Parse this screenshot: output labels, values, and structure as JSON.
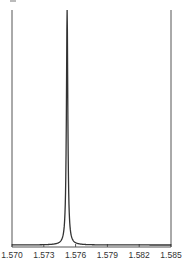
{
  "chart_data": {
    "type": "line",
    "title": "",
    "xlabel": "",
    "ylabel": "",
    "xlim": [
      1.57,
      1.585
    ],
    "ylim": [
      0,
      1
    ],
    "grid": false,
    "legend": null,
    "x_ticks": [
      "1.570",
      "1.573",
      "1.576",
      "1.579",
      "1.582",
      "1.585"
    ],
    "x_tick_values": [
      1.57,
      1.573,
      1.576,
      1.579,
      1.582,
      1.585
    ],
    "series": [
      {
        "name": "spectrum",
        "shape": "single sharp Lorentzian peak",
        "peak_x": 1.5752,
        "peak_y": 1.0,
        "baseline_y": 0.0,
        "half_width": 8e-05,
        "color": "#333333"
      }
    ]
  },
  "colors": {
    "axis": "#555555",
    "line": "#333333",
    "background": "#ffffff"
  }
}
